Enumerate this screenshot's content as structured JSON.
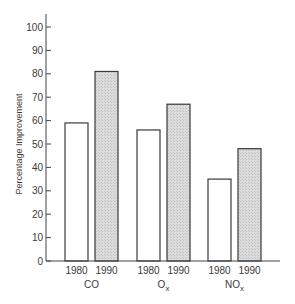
{
  "chart_data": {
    "type": "bar",
    "title": "",
    "xlabel": "",
    "ylabel": "Percentage Improvement",
    "ylim": [
      0,
      100
    ],
    "yticks": [
      0,
      10,
      20,
      30,
      40,
      50,
      60,
      70,
      80,
      90,
      100
    ],
    "grid": false,
    "legend": "none",
    "categories": [
      "CO",
      "Ox",
      "NOx"
    ],
    "category_labels": [
      {
        "main": "CO",
        "sub": ""
      },
      {
        "main": "O",
        "sub": "x"
      },
      {
        "main": "NO",
        "sub": "x"
      }
    ],
    "series": [
      {
        "name": "1980",
        "values": [
          59,
          56,
          35
        ],
        "fill": "#ffffff"
      },
      {
        "name": "1990",
        "values": [
          81,
          67,
          48
        ],
        "fill": "#d9d9d9"
      }
    ]
  },
  "colors": {
    "axis": "#444444",
    "bar_outline": "#3a3a3a",
    "bar_1980": "#ffffff",
    "bar_1990": "#d9d9d9"
  }
}
